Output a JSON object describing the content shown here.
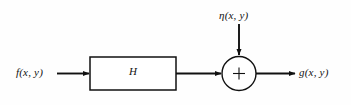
{
  "diagram": {
    "background_color": "#fefefe",
    "stroke_color": "#111111",
    "input": {
      "label": "f(x, y)",
      "name": "input-signal-label"
    },
    "block": {
      "label": "H",
      "name": "degradation-function-block"
    },
    "noise": {
      "label": "η(x, y)",
      "name": "noise-source-label"
    },
    "summing_junction": {
      "operator": "+",
      "name": "summing-junction"
    },
    "output": {
      "label": "g(x, y)",
      "name": "output-signal-label"
    },
    "edges": [
      {
        "name": "edge-input-to-block",
        "from": "f(x, y)",
        "to": "H"
      },
      {
        "name": "edge-block-to-sum",
        "from": "H",
        "to": "+"
      },
      {
        "name": "edge-noise-to-sum",
        "from": "η(x, y)",
        "to": "+"
      },
      {
        "name": "edge-sum-to-output",
        "from": "+",
        "to": "g(x, y)"
      }
    ]
  }
}
